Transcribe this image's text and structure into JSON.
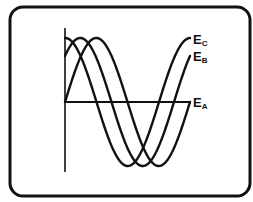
{
  "diagram": {
    "frame": {
      "x": 10,
      "y": 7,
      "width": 240,
      "height": 189,
      "radius": 13,
      "stroke": "#111111",
      "stroke_width": 3
    },
    "axes": {
      "origin": {
        "x": 65,
        "y": 102
      },
      "vertical": {
        "x": 65,
        "y1": 28,
        "y2": 172
      },
      "horizontal": {
        "y": 102,
        "x1": 65,
        "x2": 190
      }
    },
    "wave": {
      "period_px": 125,
      "amplitude_px": 64,
      "x_start": 65,
      "x_end": 190,
      "stroke": "#111111",
      "stroke_width": 2.4
    },
    "series": [
      {
        "name": "E_A",
        "label_main": "E",
        "label_sub": "A",
        "phase_offset_px": 0,
        "label_x": 193,
        "label_y": 107
      },
      {
        "name": "E_B",
        "label_main": "E",
        "label_sub": "B",
        "phase_offset_px": 16,
        "label_x": 193,
        "label_y": 61
      },
      {
        "name": "E_C",
        "label_main": "E",
        "label_sub": "C",
        "phase_offset_px": 31,
        "label_x": 193,
        "label_y": 44
      }
    ]
  }
}
